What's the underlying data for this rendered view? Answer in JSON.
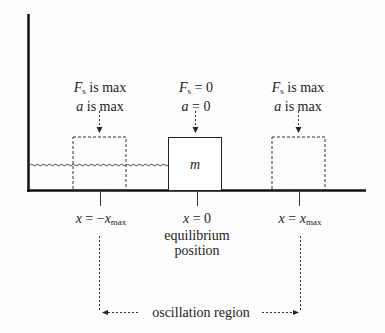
{
  "diagram": {
    "left_label": {
      "line1_var": "F",
      "line1_sub": "s",
      "line1_rest": " is max",
      "line2_var": "a",
      "line2_rest": " is max"
    },
    "center_label": {
      "line1_var": "F",
      "line1_sub": "s",
      "line1_rest": " = 0",
      "line2_var": "a",
      "line2_rest": " = 0"
    },
    "right_label": {
      "line1_var": "F",
      "line1_sub": "s",
      "line1_rest": " is max",
      "line2_var": "a",
      "line2_rest": " is max"
    },
    "mass_label": "m",
    "positions": [
      {
        "var": "x",
        "rest": " = −",
        "var2": "x",
        "sub": "max"
      },
      {
        "var": "x",
        "rest": " = 0"
      },
      {
        "var": "x",
        "rest": " = ",
        "var2": "x",
        "sub": "max"
      }
    ],
    "equilibrium_line1": "equilibrium",
    "equilibrium_line2": "position",
    "region_label": "oscillation region"
  }
}
